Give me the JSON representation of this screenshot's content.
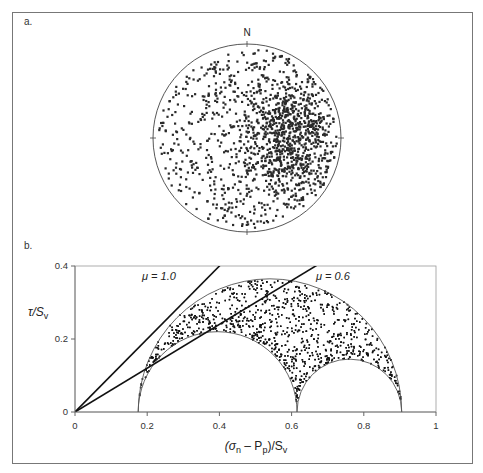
{
  "figure": {
    "panel_a": {
      "label": "a.",
      "north_label": "N",
      "plot": "lower-hemisphere stereonet of fracture poles",
      "center_px": [
        247,
        138
      ],
      "radius_px": 94,
      "num_points": 1400,
      "point_color": "#2a2a2a",
      "cluster": {
        "dx": 0.45,
        "dy": -0.05,
        "spread": 0.38,
        "fraction": 0.5
      }
    },
    "panel_b": {
      "label": "b.",
      "ylabel_main": "τ/S",
      "ylabel_sub": "v",
      "xlabel_parts": [
        "(σ",
        "n",
        " – P",
        "p",
        ")/S",
        "v"
      ],
      "annotations": [
        {
          "text": "μ = 1.0",
          "mu": 1.0
        },
        {
          "text": "μ = 0.6",
          "mu": 0.6
        }
      ],
      "num_points": 1800
    }
  },
  "chart_data": [
    {
      "type": "scatter",
      "title": "a. Stereonet (poles to fractures)",
      "xlabel": "",
      "ylabel": "",
      "legend": [],
      "annotations": [
        "N"
      ],
      "description": "Equal-area lower hemisphere projection; poles concentrated in eastern half (approx. 1400 points)"
    },
    {
      "type": "scatter",
      "title": "b. Mohr diagram",
      "xlabel": "(σn – Pp)/Sv",
      "ylabel": "τ/Sv",
      "xlim": [
        0,
        1
      ],
      "ylim": [
        0,
        0.4
      ],
      "xticks": [
        0,
        0.2,
        0.4,
        0.6,
        0.8,
        1
      ],
      "xtick_labels": [
        "0",
        "0.2",
        "0.4",
        "0.6",
        "0.8",
        "1"
      ],
      "yticks": [
        0,
        0.2,
        0.4
      ],
      "ytick_labels": [
        "0",
        "0.2",
        "0.4"
      ],
      "grid": false,
      "mohr_circles": [
        {
          "name": "σ1–σ3",
          "min": 0.175,
          "max": 0.905
        },
        {
          "name": "σ2–σ3",
          "min": 0.175,
          "max": 0.615
        },
        {
          "name": "σ1–σ2",
          "min": 0.615,
          "max": 0.905
        }
      ],
      "failure_lines": [
        {
          "name": "μ = 1.0",
          "slope": 1.0,
          "intercept": 0
        },
        {
          "name": "μ = 0.6",
          "slope": 0.6,
          "intercept": 0
        }
      ],
      "series": [
        {
          "name": "fracture stress states",
          "description": "~1800 points filling region between large circle and two smaller circles, denser near small circles"
        }
      ]
    }
  ]
}
